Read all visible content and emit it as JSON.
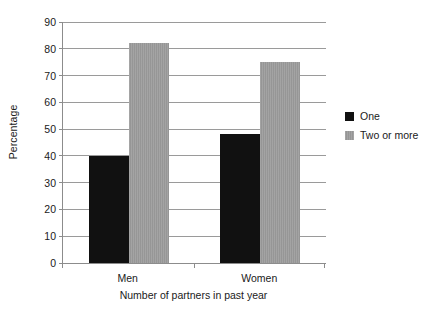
{
  "chart_data": {
    "type": "bar",
    "title": "",
    "xlabel": "Number of partners in past year",
    "ylabel": "Percentage",
    "categories": [
      "Men",
      "Women"
    ],
    "series": [
      {
        "name": "One",
        "color": "#111111",
        "values": [
          40,
          48
        ]
      },
      {
        "name": "Two or more",
        "color": "#969696",
        "values": [
          82,
          75
        ]
      }
    ],
    "ylim": [
      0,
      90
    ],
    "ytick_step": 10,
    "yticks": [
      90,
      80,
      70,
      60,
      50,
      40,
      30,
      20,
      10,
      0
    ],
    "ytick_labels": [
      "90",
      "80",
      "70",
      "60",
      "50",
      "40",
      "30",
      "20",
      "10",
      "0"
    ],
    "grid": "horizontal",
    "legend_position": "right",
    "background_color": "#ffffff",
    "gridline_color": "#9a9a9a",
    "axis_color": "#8c8c8c"
  },
  "legend": {
    "items": [
      {
        "label": "One",
        "swatch": "#111111"
      },
      {
        "label": "Two or more",
        "swatch": "#969696"
      }
    ]
  }
}
